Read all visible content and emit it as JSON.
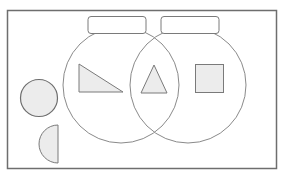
{
  "diagram": {
    "type": "venn-diagram-sorting",
    "colors": {
      "frame": "#6e6e6e",
      "circle_stroke": "#8a8a8a",
      "shape_stroke": "#7a7a7a",
      "shape_fill": "#ececec",
      "label_box_stroke": "#7a7a7a",
      "background": "#ffffff"
    },
    "sets": [
      {
        "id": "left-set",
        "label": ""
      },
      {
        "id": "right-set",
        "label": ""
      }
    ],
    "shapes": [
      {
        "id": "right-triangle",
        "kind": "right-triangle",
        "region": "left-only"
      },
      {
        "id": "triangle",
        "kind": "triangle",
        "region": "intersection"
      },
      {
        "id": "square",
        "kind": "square",
        "region": "right-only"
      },
      {
        "id": "circle",
        "kind": "circle",
        "region": "outside"
      },
      {
        "id": "semicircle",
        "kind": "semicircle",
        "region": "outside"
      }
    ]
  }
}
